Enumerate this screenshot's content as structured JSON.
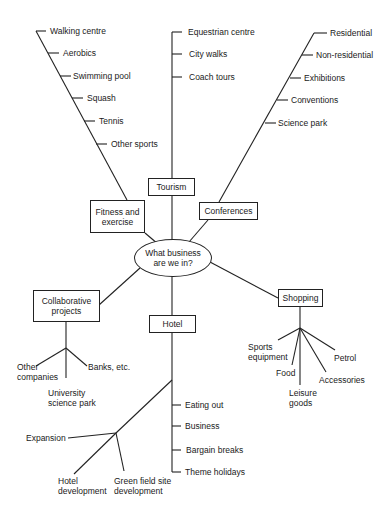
{
  "center": {
    "label": "What business are we in?"
  },
  "fitness": {
    "label": "Fitness and exercise",
    "items": [
      "Walking centre",
      "Aerobics",
      "Swimming pool",
      "Squash",
      "Tennis",
      "Other sports"
    ]
  },
  "tourism": {
    "label": "Tourism",
    "items": [
      "Equestrian centre",
      "City walks",
      "Coach tours"
    ]
  },
  "conferences": {
    "label": "Conferences",
    "items": [
      "Residential",
      "Non-residential",
      "Exhibitions",
      "Conventions",
      "Science park"
    ]
  },
  "collaborative": {
    "label": "Collaborative projects",
    "items": [
      "Other companies",
      "Banks, etc.",
      "University science park"
    ]
  },
  "hotel": {
    "label": "Hotel",
    "items": [
      "Eating out",
      "Business",
      "Bargain breaks",
      "Theme holidays"
    ],
    "expansion": {
      "label": "Expansion",
      "items": [
        "Hotel development",
        "Green field site development"
      ]
    }
  },
  "shopping": {
    "label": "Shopping",
    "items": [
      "Sports equipment",
      "Food",
      "Leisure goods",
      "Accessories",
      "Petrol"
    ]
  }
}
